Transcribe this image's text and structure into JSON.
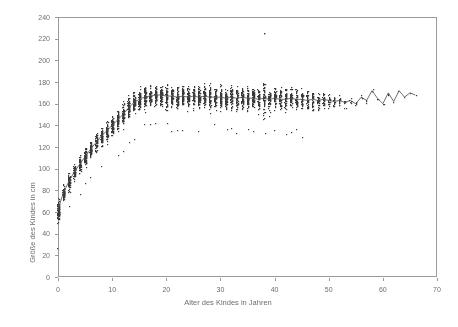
{
  "figure": {
    "background": "#ffffff",
    "frame_color": "#9a9a9a",
    "point_color": "#3a3a3a",
    "line_color": "#555555",
    "text_color": "#6e6e6e"
  },
  "axes": {
    "xlabel": "Alter des Kindes in Jahren",
    "ylabel": "Größe des Kindes in cm",
    "xticks": [
      "0",
      "10",
      "20",
      "30",
      "40",
      "50",
      "60",
      "70"
    ],
    "yticks": [
      "0",
      "20",
      "40",
      "60",
      "80",
      "100",
      "120",
      "140",
      "160",
      "180",
      "200",
      "220",
      "240"
    ]
  },
  "chart_data": {
    "type": "scatter",
    "title": "",
    "xlabel": "Alter des Kindes in Jahren",
    "ylabel": "Größe des Kindes in cm",
    "xlim": [
      0,
      70
    ],
    "ylim": [
      0,
      240
    ],
    "xtick_values": [
      0,
      10,
      20,
      30,
      40,
      50,
      60,
      70
    ],
    "ytick_values": [
      0,
      20,
      40,
      60,
      80,
      100,
      120,
      140,
      160,
      180,
      200,
      220,
      240
    ],
    "grid": false,
    "legend": "none",
    "marker": "small filled square",
    "series": [
      {
        "name": "Beobachtungen",
        "type": "scatter",
        "note": "Jede Altersstufe enthält eine vertikale Punktwolke; Anzahl und Streuung je Alter unten angegeben.",
        "age_bins": [
          {
            "x": 0,
            "n": 90,
            "mean": 62,
            "min": 35,
            "max": 82
          },
          {
            "x": 1,
            "n": 70,
            "mean": 78,
            "min": 60,
            "max": 95
          },
          {
            "x": 2,
            "n": 62,
            "mean": 88,
            "min": 70,
            "max": 103
          },
          {
            "x": 3,
            "n": 60,
            "mean": 97,
            "min": 80,
            "max": 112
          },
          {
            "x": 4,
            "n": 62,
            "mean": 104,
            "min": 86,
            "max": 120
          },
          {
            "x": 5,
            "n": 64,
            "mean": 111,
            "min": 93,
            "max": 128
          },
          {
            "x": 6,
            "n": 66,
            "mean": 118,
            "min": 98,
            "max": 136
          },
          {
            "x": 7,
            "n": 66,
            "mean": 124,
            "min": 104,
            "max": 142
          },
          {
            "x": 8,
            "n": 68,
            "mean": 130,
            "min": 110,
            "max": 148
          },
          {
            "x": 9,
            "n": 68,
            "mean": 135,
            "min": 114,
            "max": 155
          },
          {
            "x": 10,
            "n": 70,
            "mean": 140,
            "min": 118,
            "max": 160
          },
          {
            "x": 11,
            "n": 70,
            "mean": 145,
            "min": 122,
            "max": 166
          },
          {
            "x": 12,
            "n": 72,
            "mean": 150,
            "min": 126,
            "max": 172
          },
          {
            "x": 13,
            "n": 72,
            "mean": 156,
            "min": 130,
            "max": 178
          },
          {
            "x": 14,
            "n": 74,
            "mean": 161,
            "min": 134,
            "max": 183
          },
          {
            "x": 15,
            "n": 74,
            "mean": 164,
            "min": 140,
            "max": 186
          },
          {
            "x": 16,
            "n": 74,
            "mean": 166,
            "min": 143,
            "max": 188
          },
          {
            "x": 17,
            "n": 76,
            "mean": 167,
            "min": 145,
            "max": 190
          },
          {
            "x": 18,
            "n": 76,
            "mean": 168,
            "min": 146,
            "max": 190
          },
          {
            "x": 19,
            "n": 74,
            "mean": 168,
            "min": 146,
            "max": 191
          },
          {
            "x": 20,
            "n": 74,
            "mean": 167,
            "min": 145,
            "max": 190
          },
          {
            "x": 21,
            "n": 72,
            "mean": 167,
            "min": 145,
            "max": 189
          },
          {
            "x": 22,
            "n": 72,
            "mean": 166,
            "min": 144,
            "max": 190
          },
          {
            "x": 23,
            "n": 70,
            "mean": 167,
            "min": 144,
            "max": 189
          },
          {
            "x": 24,
            "n": 70,
            "mean": 166,
            "min": 143,
            "max": 188
          },
          {
            "x": 25,
            "n": 70,
            "mean": 167,
            "min": 144,
            "max": 190
          },
          {
            "x": 26,
            "n": 68,
            "mean": 166,
            "min": 143,
            "max": 188
          },
          {
            "x": 27,
            "n": 68,
            "mean": 167,
            "min": 144,
            "max": 189
          },
          {
            "x": 28,
            "n": 68,
            "mean": 166,
            "min": 142,
            "max": 191
          },
          {
            "x": 29,
            "n": 66,
            "mean": 166,
            "min": 143,
            "max": 188
          },
          {
            "x": 30,
            "n": 66,
            "mean": 166,
            "min": 142,
            "max": 189
          },
          {
            "x": 31,
            "n": 64,
            "mean": 165,
            "min": 141,
            "max": 187
          },
          {
            "x": 32,
            "n": 64,
            "mean": 166,
            "min": 142,
            "max": 188
          },
          {
            "x": 33,
            "n": 62,
            "mean": 165,
            "min": 141,
            "max": 187
          },
          {
            "x": 34,
            "n": 62,
            "mean": 166,
            "min": 142,
            "max": 188
          },
          {
            "x": 35,
            "n": 60,
            "mean": 165,
            "min": 140,
            "max": 187
          },
          {
            "x": 36,
            "n": 58,
            "mean": 165,
            "min": 141,
            "max": 186
          },
          {
            "x": 37,
            "n": 58,
            "mean": 164,
            "min": 140,
            "max": 186
          },
          {
            "x": 38,
            "n": 56,
            "mean": 165,
            "min": 140,
            "max": 225
          },
          {
            "x": 39,
            "n": 54,
            "mean": 164,
            "min": 140,
            "max": 186
          },
          {
            "x": 40,
            "n": 54,
            "mean": 165,
            "min": 139,
            "max": 185
          },
          {
            "x": 41,
            "n": 50,
            "mean": 164,
            "min": 139,
            "max": 185
          },
          {
            "x": 42,
            "n": 48,
            "mean": 164,
            "min": 138,
            "max": 184
          },
          {
            "x": 43,
            "n": 46,
            "mean": 165,
            "min": 140,
            "max": 185
          },
          {
            "x": 44,
            "n": 44,
            "mean": 164,
            "min": 139,
            "max": 184
          },
          {
            "x": 45,
            "n": 42,
            "mean": 164,
            "min": 138,
            "max": 184
          },
          {
            "x": 46,
            "n": 38,
            "mean": 163,
            "min": 138,
            "max": 183
          },
          {
            "x": 47,
            "n": 34,
            "mean": 164,
            "min": 139,
            "max": 183
          },
          {
            "x": 48,
            "n": 30,
            "mean": 163,
            "min": 140,
            "max": 182
          },
          {
            "x": 49,
            "n": 26,
            "mean": 164,
            "min": 142,
            "max": 182
          },
          {
            "x": 50,
            "n": 20,
            "mean": 163,
            "min": 143,
            "max": 180
          },
          {
            "x": 51,
            "n": 16,
            "mean": 162,
            "min": 145,
            "max": 178
          },
          {
            "x": 52,
            "n": 12,
            "mean": 163,
            "min": 148,
            "max": 176
          },
          {
            "x": 53,
            "n": 9,
            "mean": 161,
            "min": 150,
            "max": 174
          },
          {
            "x": 54,
            "n": 7,
            "mean": 163,
            "min": 152,
            "max": 175
          },
          {
            "x": 55,
            "n": 5,
            "mean": 160,
            "min": 152,
            "max": 170
          },
          {
            "x": 56,
            "n": 4,
            "mean": 166,
            "min": 158,
            "max": 172
          },
          {
            "x": 57,
            "n": 3,
            "mean": 163,
            "min": 158,
            "max": 170
          },
          {
            "x": 58,
            "n": 3,
            "mean": 172,
            "min": 165,
            "max": 176
          },
          {
            "x": 59,
            "n": 2,
            "mean": 165,
            "min": 162,
            "max": 170
          },
          {
            "x": 60,
            "n": 2,
            "mean": 160,
            "min": 157,
            "max": 164
          },
          {
            "x": 61,
            "n": 2,
            "mean": 170,
            "min": 166,
            "max": 174
          },
          {
            "x": 62,
            "n": 1,
            "mean": 162,
            "min": 162,
            "max": 162
          },
          {
            "x": 63,
            "n": 1,
            "mean": 172,
            "min": 172,
            "max": 172
          },
          {
            "x": 64,
            "n": 1,
            "mean": 166,
            "min": 166,
            "max": 166
          },
          {
            "x": 65,
            "n": 1,
            "mean": 170,
            "min": 170,
            "max": 170
          },
          {
            "x": 66,
            "n": 1,
            "mean": 168,
            "min": 168,
            "max": 168
          }
        ]
      },
      {
        "name": "Mittelwertlinie",
        "type": "line",
        "x": [
          0,
          1,
          2,
          3,
          4,
          5,
          6,
          7,
          8,
          9,
          10,
          11,
          12,
          13,
          14,
          15,
          16,
          17,
          18,
          19,
          20,
          21,
          22,
          23,
          24,
          25,
          26,
          27,
          28,
          29,
          30,
          31,
          32,
          33,
          34,
          35,
          36,
          37,
          38,
          39,
          40,
          41,
          42,
          43,
          44,
          45,
          46,
          47,
          48,
          49,
          50,
          51,
          52,
          53,
          54,
          55,
          56,
          57,
          58,
          59,
          60,
          61,
          62,
          63,
          64,
          65,
          66
        ],
        "values": [
          62,
          78,
          88,
          97,
          104,
          111,
          118,
          124,
          130,
          135,
          140,
          145,
          150,
          156,
          161,
          164,
          166,
          167,
          168,
          168,
          167,
          167,
          166,
          167,
          166,
          167,
          166,
          167,
          166,
          166,
          166,
          165,
          166,
          165,
          166,
          165,
          165,
          164,
          165,
          164,
          165,
          164,
          164,
          165,
          164,
          164,
          163,
          164,
          163,
          164,
          163,
          162,
          163,
          161,
          163,
          160,
          166,
          163,
          172,
          165,
          160,
          170,
          162,
          172,
          166,
          170,
          168
        ]
      }
    ],
    "annotations": [
      {
        "text": "Ausreißer",
        "x": 38,
        "y": 225
      }
    ]
  }
}
